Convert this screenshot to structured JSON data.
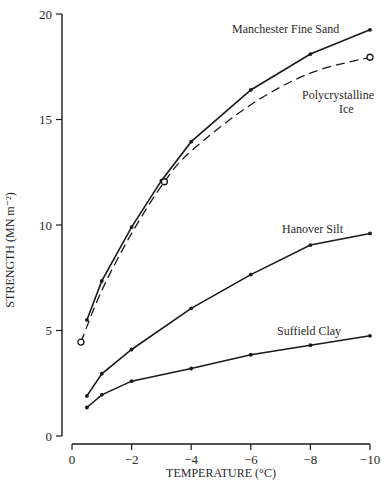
{
  "chart_data": {
    "type": "line",
    "title": "",
    "xlabel": "TEMPERATURE (°C)",
    "ylabel": "STRENGTH  (MN m⁻²)",
    "xlim": [
      0,
      -10
    ],
    "ylim": [
      0,
      20
    ],
    "x_ticks": [
      0,
      -2,
      -4,
      -6,
      -8,
      -10
    ],
    "x_tick_labels": [
      "0",
      "−2",
      "−4",
      "−6",
      "−8",
      "−10"
    ],
    "y_ticks": [
      0,
      5,
      10,
      15,
      20
    ],
    "y_tick_labels": [
      "0",
      "5",
      "10",
      "15",
      "20"
    ],
    "grid": false,
    "legend": "inline labels next to curves",
    "series": [
      {
        "name": "Manchester Fine Sand",
        "style": "solid",
        "marker": "dot",
        "x": [
          -0.5,
          -1,
          -2,
          -3,
          -4,
          -6,
          -8,
          -10
        ],
        "y": [
          5.5,
          7.35,
          9.9,
          12.1,
          13.95,
          16.4,
          18.1,
          19.25
        ]
      },
      {
        "name": "Polycrystalline Ice",
        "style": "dashed",
        "marker": "open-circle",
        "x": [
          -0.3,
          -3.1,
          -10
        ],
        "y": [
          4.45,
          12.05,
          17.95
        ],
        "curve_x": [
          -0.3,
          -1,
          -2,
          -3.1,
          -4,
          -6,
          -8,
          -10
        ],
        "curve_y": [
          4.45,
          6.9,
          9.6,
          12.05,
          13.5,
          15.7,
          17.2,
          17.95
        ]
      },
      {
        "name": "Hanover Silt",
        "style": "solid",
        "marker": "dot",
        "x": [
          -0.5,
          -1,
          -2,
          -4,
          -6,
          -8,
          -10
        ],
        "y": [
          1.9,
          2.95,
          4.1,
          6.05,
          7.65,
          9.05,
          9.6
        ]
      },
      {
        "name": "Suffield Clay",
        "style": "solid",
        "marker": "dot",
        "x": [
          -0.5,
          -1,
          -2,
          -4,
          -6,
          -8,
          -10
        ],
        "y": [
          1.35,
          1.95,
          2.6,
          3.2,
          3.85,
          4.3,
          4.75
        ]
      }
    ],
    "annotations": [
      {
        "text": "Manchester Fine Sand",
        "near": [
          -10,
          19.25
        ]
      },
      {
        "text": "Polycrystalline",
        "near": [
          -8.5,
          16.4
        ]
      },
      {
        "text": "Ice",
        "near": [
          -8.5,
          15.6
        ]
      },
      {
        "text": "Hanover Silt",
        "near": [
          -7.5,
          9.8
        ]
      },
      {
        "text": "Suffield Clay",
        "near": [
          -7.5,
          4.9
        ]
      }
    ]
  },
  "labels": {
    "sand": "Manchester Fine Sand",
    "ice_line1": "Polycrystalline",
    "ice_line2": "Ice",
    "silt": "Hanover Silt",
    "clay": "Suffield Clay",
    "xlabel": "TEMPERATURE (°C)",
    "ylabel": "STRENGTH  (MN m⁻²)"
  }
}
